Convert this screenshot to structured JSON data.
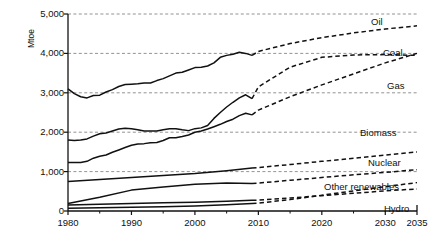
{
  "chart_data": {
    "type": "line",
    "title": "",
    "subtitle": "",
    "xlabel": "",
    "ylabel": "Mtoe",
    "xlim": [
      1980,
      2035
    ],
    "ylim": [
      0,
      5000
    ],
    "grid": true,
    "grid_axis": "y",
    "legend_position": "inline-right-end-labels",
    "annotations": "Solid segments are historical (1980-2009); dashed segments are projections (2009-2035).",
    "y_ticks": [
      0,
      1000,
      2000,
      3000,
      4000,
      5000
    ],
    "y_tick_labels": [
      "0",
      "1,000",
      "2,000",
      "3,000",
      "4,000",
      "5,000"
    ],
    "x_ticks": [
      1980,
      1990,
      2000,
      2010,
      2020,
      2030,
      2035
    ],
    "x_tick_labels": [
      "1980",
      "1990",
      "2000",
      "2010",
      "2020",
      "2030",
      "2035"
    ],
    "x_minor_ticks": [
      1985,
      1995,
      2005,
      2015,
      2025
    ],
    "history_end_year": 2009,
    "series": [
      {
        "name": "Oil",
        "label": "Oil",
        "color": "#111111",
        "x": [
          1980,
          1981,
          1982,
          1983,
          1984,
          1985,
          1986,
          1987,
          1988,
          1989,
          1990,
          1991,
          1992,
          1993,
          1994,
          1995,
          1996,
          1997,
          1998,
          1999,
          2000,
          2001,
          2002,
          2003,
          2004,
          2005,
          2006,
          2007,
          2008,
          2009,
          2010,
          2015,
          2020,
          2025,
          2030,
          2035
        ],
        "values": [
          3100,
          2980,
          2900,
          2870,
          2930,
          2940,
          3020,
          3080,
          3160,
          3210,
          3220,
          3230,
          3250,
          3250,
          3310,
          3360,
          3430,
          3500,
          3520,
          3580,
          3640,
          3650,
          3680,
          3760,
          3900,
          3950,
          3980,
          4030,
          4000,
          3950,
          4050,
          4250,
          4400,
          4520,
          4620,
          4700
        ]
      },
      {
        "name": "Coal",
        "label": "Coal",
        "color": "#111111",
        "x": [
          1980,
          1981,
          1982,
          1983,
          1984,
          1985,
          1986,
          1987,
          1988,
          1989,
          1990,
          1991,
          1992,
          1993,
          1994,
          1995,
          1996,
          1997,
          1998,
          1999,
          2000,
          2001,
          2002,
          2003,
          2004,
          2005,
          2006,
          2007,
          2008,
          2009,
          2010,
          2015,
          2020,
          2025,
          2030,
          2035
        ],
        "values": [
          1800,
          1790,
          1800,
          1830,
          1900,
          1960,
          1980,
          2030,
          2080,
          2100,
          2090,
          2060,
          2030,
          2030,
          2030,
          2060,
          2090,
          2090,
          2060,
          2040,
          2090,
          2110,
          2170,
          2350,
          2500,
          2640,
          2760,
          2870,
          2950,
          2850,
          3150,
          3650,
          3900,
          3960,
          3970,
          3950
        ]
      },
      {
        "name": "Gas",
        "label": "Gas",
        "color": "#111111",
        "x": [
          1980,
          1981,
          1982,
          1983,
          1984,
          1985,
          1986,
          1987,
          1988,
          1989,
          1990,
          1991,
          1992,
          1993,
          1994,
          1995,
          1996,
          1997,
          1998,
          1999,
          2000,
          2001,
          2002,
          2003,
          2004,
          2005,
          2006,
          2007,
          2008,
          2009,
          2010,
          2015,
          2020,
          2025,
          2030,
          2035
        ],
        "values": [
          1230,
          1230,
          1230,
          1260,
          1340,
          1390,
          1420,
          1490,
          1550,
          1610,
          1670,
          1700,
          1710,
          1730,
          1740,
          1790,
          1860,
          1860,
          1890,
          1930,
          2000,
          2030,
          2080,
          2140,
          2200,
          2270,
          2330,
          2420,
          2480,
          2440,
          2560,
          2900,
          3200,
          3480,
          3760,
          4000
        ]
      },
      {
        "name": "Biomass",
        "label": "Biomass",
        "color": "#111111",
        "x": [
          1980,
          1985,
          1990,
          1995,
          2000,
          2005,
          2009,
          2010,
          2015,
          2020,
          2025,
          2030,
          2035
        ],
        "values": [
          750,
          800,
          850,
          900,
          950,
          1020,
          1090,
          1100,
          1180,
          1260,
          1340,
          1420,
          1500
        ]
      },
      {
        "name": "Nuclear",
        "label": "Nuclear",
        "color": "#111111",
        "x": [
          1980,
          1985,
          1990,
          1995,
          2000,
          2005,
          2009,
          2010,
          2015,
          2020,
          2025,
          2030,
          2035
        ],
        "values": [
          190,
          350,
          530,
          610,
          680,
          710,
          700,
          710,
          780,
          850,
          920,
          980,
          1050
        ]
      },
      {
        "name": "Other renewables",
        "label": "Other renewables",
        "color": "#111111",
        "x": [
          1980,
          1985,
          1990,
          1995,
          2000,
          2005,
          2009,
          2010,
          2015,
          2020,
          2025,
          2030,
          2035
        ],
        "values": [
          70,
          80,
          95,
          110,
          130,
          160,
          190,
          200,
          290,
          400,
          510,
          620,
          720
        ]
      },
      {
        "name": "Hydro",
        "label": "Hydro",
        "color": "#111111",
        "x": [
          1980,
          1985,
          1990,
          1995,
          2000,
          2005,
          2009,
          2010,
          2015,
          2020,
          2025,
          2030,
          2035
        ],
        "values": [
          150,
          170,
          190,
          210,
          225,
          250,
          270,
          275,
          330,
          390,
          450,
          510,
          560
        ]
      }
    ],
    "series_labels": [
      {
        "name": "Oil",
        "text": "Oil"
      },
      {
        "name": "Coal",
        "text": "Coal"
      },
      {
        "name": "Gas",
        "text": "Gas"
      },
      {
        "name": "Biomass",
        "text": "Biomass"
      },
      {
        "name": "Nuclear",
        "text": "Nuclear"
      },
      {
        "name": "Other renewables",
        "text": "Other renewables"
      },
      {
        "name": "Hydro",
        "text": "Hydro"
      }
    ]
  },
  "label_positions": {
    "Oil": {
      "x": 371,
      "y": 16
    },
    "Coal": {
      "x": 383,
      "y": 47
    },
    "Gas": {
      "x": 387,
      "y": 80
    },
    "Biomass": {
      "x": 360,
      "y": 127
    },
    "Nuclear": {
      "x": 368,
      "y": 157
    },
    "Other renewables": {
      "x": 324,
      "y": 181
    },
    "Hydro": {
      "x": 384,
      "y": 203
    }
  }
}
